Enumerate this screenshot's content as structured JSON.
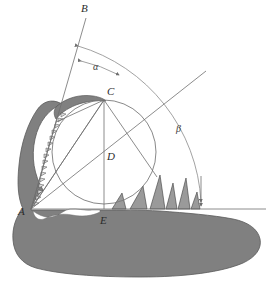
{
  "figure": {
    "background_color": "#ffffff",
    "width": 273,
    "height": 288,
    "caption": ""
  },
  "colors": {
    "jaw_fill": "#808080",
    "jaw_stroke": "#5a5a5a",
    "construction_line": "#6e6e6e",
    "circle_stroke": "#7a7a7a",
    "arc_stroke": "#8a8a8a",
    "label_text": "#2b2b2b",
    "tooth_fill": "#9a9a9a",
    "tooth_stroke": "#4a4a4a"
  },
  "labels": [
    {
      "id": "label-B-top",
      "text": "B",
      "x": 81,
      "y": 12,
      "style": "italic"
    },
    {
      "id": "label-alpha",
      "text": "α",
      "x": 93,
      "y": 70,
      "style": "greek"
    },
    {
      "id": "label-C",
      "text": "C",
      "x": 107,
      "y": 95,
      "style": "italic"
    },
    {
      "id": "label-beta",
      "text": "β",
      "x": 176,
      "y": 132,
      "style": "greek"
    },
    {
      "id": "label-D",
      "text": "D",
      "x": 107,
      "y": 160,
      "style": "italic"
    },
    {
      "id": "label-A",
      "text": "A",
      "x": 18,
      "y": 215,
      "style": "italic"
    },
    {
      "id": "label-E",
      "text": "E",
      "x": 100,
      "y": 224,
      "style": "italic"
    }
  ],
  "geometry": {
    "point_A": {
      "x": 31,
      "y": 209
    },
    "point_C": {
      "x": 104,
      "y": 100
    },
    "point_D": {
      "x": 104,
      "y": 152
    },
    "point_E": {
      "x": 104,
      "y": 209
    },
    "circle": {
      "cx": 104,
      "cy": 152,
      "r": 52
    },
    "baseline": {
      "x1": 31,
      "y1": 209,
      "x2": 266,
      "y2": 209
    },
    "ray_B": {
      "x1": 31,
      "y1": 209,
      "x2": 86,
      "y2": 18
    },
    "ray_beta": {
      "x1": 31,
      "y1": 209,
      "x2": 206,
      "y2": 71
    },
    "arc_outer_label": "outer reference arc",
    "arc_alpha_label": "alpha angle arc",
    "arc_beta_label": "beta angle arc"
  },
  "annotations": {
    "alpha_symbol": "α",
    "beta_symbol": "β",
    "vertex_labels": [
      "A",
      "B",
      "C",
      "D",
      "E"
    ]
  }
}
